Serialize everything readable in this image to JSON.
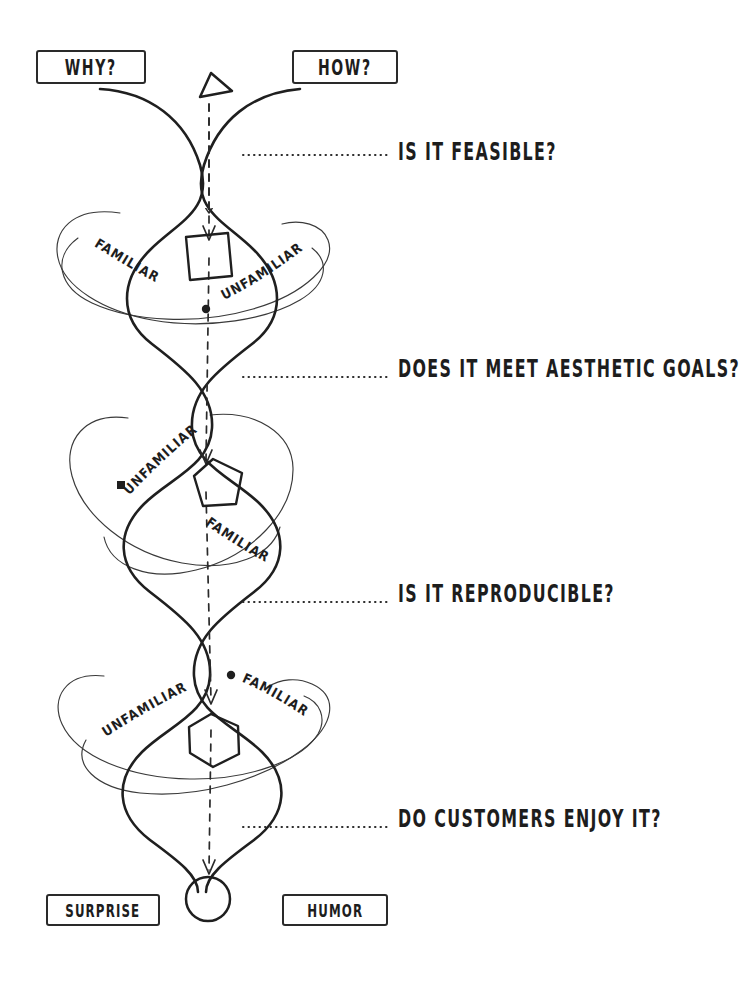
{
  "diagram": {
    "style": "hand-drawn sketch, black ink on white",
    "ink_color": "#2a2a2a",
    "background_color": "#ffffff"
  },
  "top_labels": {
    "left": "WHY?",
    "right": "HOW?"
  },
  "bottom_labels": {
    "left": "SURPRISE",
    "right": "HUMOR"
  },
  "questions": [
    {
      "text": "IS IT FEASIBLE?"
    },
    {
      "text": "DOES IT MEET AESTHETIC GOALS?"
    },
    {
      "text": "IS IT REPRODUCIBLE?"
    },
    {
      "text": "DO CUSTOMERS ENJOY IT?"
    }
  ],
  "nodes": [
    {
      "index": 1,
      "shape": "square",
      "left_ring_label": "FAMILIAR",
      "right_ring_label": "UNFAMILIAR"
    },
    {
      "index": 2,
      "shape": "pentagon",
      "left_ring_label": "UNFAMILIAR",
      "right_ring_label": "FAMILIAR"
    },
    {
      "index": 3,
      "shape": "hexagon",
      "left_ring_label": "UNFAMILIAR",
      "right_ring_label": "FAMILIAR"
    }
  ],
  "markers": {
    "top_shape": "triangle",
    "bottom_shape": "circle",
    "flow_arrow": "dashed-downward-arrow"
  }
}
